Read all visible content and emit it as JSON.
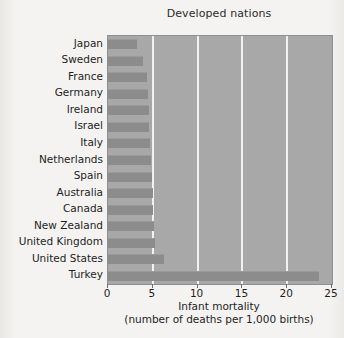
{
  "chart_data": {
    "type": "bar",
    "orientation": "horizontal",
    "title": "Developed nations",
    "xlabel_line1": "Infant mortality",
    "xlabel_line2": "(number of deaths per 1,000 births)",
    "ylabel": "",
    "xlim": [
      0,
      25
    ],
    "xticks": [
      0,
      5,
      10,
      15,
      20,
      25
    ],
    "xtick_labels": [
      "0",
      "5",
      "10",
      "15",
      "20",
      "25"
    ],
    "grid": "vertical gridlines at 5, 10, 15, 20",
    "gridlines": [
      5,
      10,
      15,
      20
    ],
    "legend": null,
    "legend_position": "none",
    "categories": [
      "Japan",
      "Sweden",
      "France",
      "Germany",
      "Ireland",
      "Israel",
      "Italy",
      "Netherlands",
      "Spain",
      "Australia",
      "Canada",
      "New Zealand",
      "United Kingdom",
      "United States",
      "Turkey"
    ],
    "values": [
      3.2,
      3.9,
      4.4,
      4.5,
      4.6,
      4.6,
      4.7,
      4.8,
      4.9,
      5.0,
      5.0,
      5.1,
      5.2,
      6.3,
      23.6
    ],
    "bar_color": "#8c8c8c",
    "plot_background": "#a8a8a8",
    "figure_background": "#f4f3f1",
    "gridline_color": "#f2f1ef"
  },
  "title": "Developed nations",
  "axis": {
    "x_title_line1": "Infant mortality",
    "x_title_line2": "(number of deaths per 1,000 births)"
  }
}
